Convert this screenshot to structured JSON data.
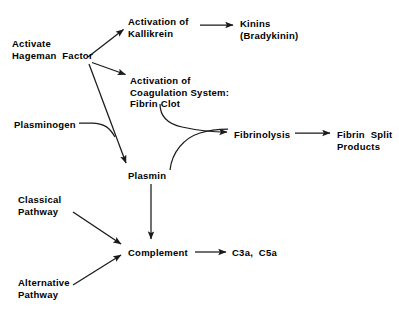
{
  "diagram": {
    "background_color": "#ffffff",
    "line_color": "#1a1a1a",
    "text_color": "#000000",
    "nodes": [
      {
        "id": "activate-hageman-factor",
        "name": "activate-hageman-factor-label",
        "lines": [
          "Activate",
          "Hageman  Factor"
        ],
        "x": 12,
        "y": 38,
        "align": "left"
      },
      {
        "id": "activation-of-kallikrein",
        "name": "activation-of-kallikrein-label",
        "lines": [
          "Activation of",
          "Kallikrein"
        ],
        "x": 128,
        "y": 16,
        "align": "left"
      },
      {
        "id": "kinins",
        "name": "kinins-label",
        "lines": [
          "Kinins",
          "(Bradykinin)"
        ],
        "x": 240,
        "y": 18,
        "align": "left"
      },
      {
        "id": "activation-of-coagulation-system",
        "name": "activation-of-coagulation-system-label",
        "lines": [
          "Activation of",
          "Coagulation System:",
          "Fibrin Clot"
        ],
        "x": 130,
        "y": 75,
        "align": "left"
      },
      {
        "id": "plasminogen",
        "name": "plasminogen-label",
        "lines": [
          "Plasminogen"
        ],
        "x": 14,
        "y": 119,
        "align": "left"
      },
      {
        "id": "fibrinolysis",
        "name": "fibrinolysis-label",
        "lines": [
          "Fibrinolysis"
        ],
        "x": 234,
        "y": 129,
        "align": "left"
      },
      {
        "id": "fibrin-split-products",
        "name": "fibrin-split-products-label",
        "lines": [
          "Fibrin  Split",
          "Products"
        ],
        "x": 337,
        "y": 129,
        "align": "left"
      },
      {
        "id": "plasmin",
        "name": "plasmin-label",
        "lines": [
          "Plasmin"
        ],
        "x": 128,
        "y": 170,
        "align": "left"
      },
      {
        "id": "classical-pathway",
        "name": "classical-pathway-label",
        "lines": [
          "Classical",
          "Pathway"
        ],
        "x": 18,
        "y": 194,
        "align": "left"
      },
      {
        "id": "complement",
        "name": "complement-label",
        "lines": [
          "Complement"
        ],
        "x": 128,
        "y": 247,
        "align": "left"
      },
      {
        "id": "c3a-c5a",
        "name": "c3a-c5a-label",
        "lines": [
          "C3a,  C5a"
        ],
        "x": 232,
        "y": 247,
        "align": "left"
      },
      {
        "id": "alternative-pathway",
        "name": "alternative-pathway-label",
        "lines": [
          "Alternative",
          "Pathway"
        ],
        "x": 18,
        "y": 277,
        "align": "left"
      }
    ],
    "edges": [
      {
        "id": "hageman-to-kallikrein",
        "name": "edge-hageman-to-kallikrein",
        "from": "activate-hageman-factor",
        "to": "activation-of-kallikrein",
        "style": "straight-arrow"
      },
      {
        "id": "hageman-to-coagulation",
        "name": "edge-hageman-to-coagulation",
        "from": "activate-hageman-factor",
        "to": "activation-of-coagulation-system",
        "style": "straight-arrow"
      },
      {
        "id": "hageman-to-plasmin",
        "name": "edge-hageman-to-plasmin",
        "from": "activate-hageman-factor",
        "to": "plasmin",
        "style": "straight-arrow"
      },
      {
        "id": "kallikrein-to-kinins",
        "name": "edge-kallikrein-to-kinins",
        "from": "activation-of-kallikrein",
        "to": "kinins",
        "style": "straight-arrow"
      },
      {
        "id": "plasminogen-to-plasmin",
        "name": "edge-plasminogen-to-plasmin",
        "from": "plasminogen",
        "to": "plasmin",
        "style": "curved-line"
      },
      {
        "id": "fibrin-clot-to-fibrinolysis",
        "name": "edge-fibrin-clot-to-fibrinolysis",
        "from": "activation-of-coagulation-system",
        "to": "fibrinolysis",
        "style": "curved-arrow"
      },
      {
        "id": "plasmin-to-fibrinolysis",
        "name": "edge-plasmin-to-fibrinolysis",
        "from": "plasmin",
        "to": "fibrinolysis",
        "style": "curved-arrow"
      },
      {
        "id": "fibrinolysis-to-fibrin-split-products",
        "name": "edge-fibrinolysis-to-fibrin-split-products",
        "from": "fibrinolysis",
        "to": "fibrin-split-products",
        "style": "straight-arrow"
      },
      {
        "id": "plasmin-to-complement",
        "name": "edge-plasmin-to-complement",
        "from": "plasmin",
        "to": "complement",
        "style": "straight-arrow"
      },
      {
        "id": "classical-to-complement",
        "name": "edge-classical-to-complement",
        "from": "classical-pathway",
        "to": "complement",
        "style": "straight-arrow"
      },
      {
        "id": "alternative-to-complement",
        "name": "edge-alternative-to-complement",
        "from": "alternative-pathway",
        "to": "complement",
        "style": "straight-arrow"
      },
      {
        "id": "complement-to-c3a-c5a",
        "name": "edge-complement-to-c3a-c5a",
        "from": "complement",
        "to": "c3a-c5a",
        "style": "straight-arrow"
      }
    ]
  }
}
